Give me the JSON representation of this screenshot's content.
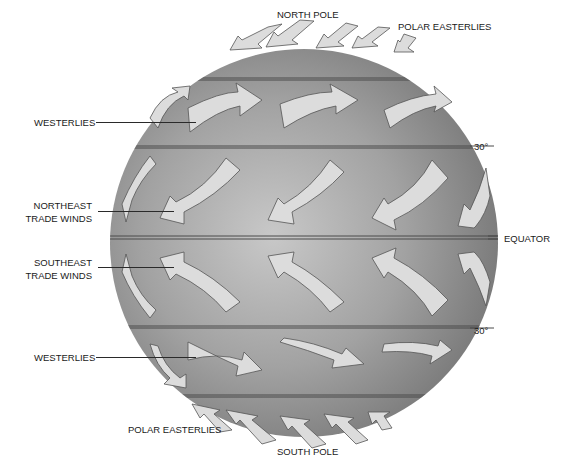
{
  "diagram": {
    "labels": {
      "north_pole": "NORTH POLE",
      "polar_easterlies_north": "POLAR EASTERLIES",
      "westerlies_north": "WESTERLIES",
      "lat_30_north": "30°",
      "northeast_trade_winds_line1": "NORTHEAST",
      "northeast_trade_winds_line2": "TRADE WINDS",
      "equator": "EQUATOR",
      "southeast_trade_winds_line1": "SOUTHEAST",
      "southeast_trade_winds_line2": "TRADE WINDS",
      "lat_30_south": "30°",
      "westerlies_south": "WESTERLIES",
      "polar_easterlies_south": "POLAR EASTERLIES",
      "south_pole": "SOUTH POLE"
    },
    "bands": [
      {
        "name": "polar-easterlies-north",
        "direction": "east-to-west (toward southwest)"
      },
      {
        "name": "westerlies-north",
        "direction": "west-to-east"
      },
      {
        "name": "northeast-trade-winds",
        "direction": "toward southwest"
      },
      {
        "name": "southeast-trade-winds",
        "direction": "toward northwest"
      },
      {
        "name": "westerlies-south",
        "direction": "west-to-east"
      },
      {
        "name": "polar-easterlies-south",
        "direction": "toward northwest"
      }
    ],
    "colors": {
      "globe_dark": "#7e7e7e",
      "globe_light": "#c4c4c4",
      "arrow_fill": "#dcdcdc",
      "arrow_stroke": "#555555",
      "text": "#1a1a1a"
    }
  }
}
